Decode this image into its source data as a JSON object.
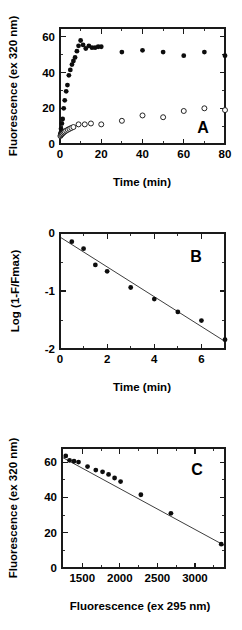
{
  "figure": {
    "panels": [
      "A",
      "B",
      "C"
    ],
    "marker_colors": {
      "filled": "#0d0d0d",
      "open_fill": "#ffffff",
      "open_stroke": "#0d0d0d",
      "axis": "#1a1a1a"
    }
  },
  "panel_a": {
    "letter": "A",
    "xlabel": "Time (min)",
    "ylabel": "Fluorescence (ex 320 nm)",
    "xticks": [
      "0",
      "20",
      "40",
      "60",
      "80"
    ],
    "yticks": [
      "0",
      "20",
      "40",
      "60"
    ]
  },
  "panel_b": {
    "letter": "B",
    "xlabel": "Time (min)",
    "ylabel": "Log (1-F/Fmax)",
    "xticks": [
      "0",
      "2",
      "4",
      "6"
    ],
    "yticks": [
      "-2",
      "-1",
      "0"
    ]
  },
  "panel_c": {
    "letter": "C",
    "xlabel": "Fluorescence (ex 295 nm)",
    "ylabel": "Fluorescence (ex 320 nm)",
    "xticks": [
      "1500",
      "2000",
      "2500",
      "3000"
    ],
    "yticks": [
      "0",
      "20",
      "40",
      "60"
    ]
  },
  "chart_data": [
    {
      "type": "scatter",
      "panel": "A",
      "title": "",
      "xlabel": "Time (min)",
      "ylabel": "Fluorescence (ex 320 nm)",
      "xlim": [
        0,
        80
      ],
      "ylim": [
        0,
        65
      ],
      "xticks": [
        0,
        20,
        40,
        60,
        80
      ],
      "yticks": [
        0,
        20,
        40,
        60
      ],
      "xminorticks": [
        10,
        30,
        50,
        70
      ],
      "yminorticks": [
        10,
        30,
        50
      ],
      "grid": false,
      "legend": false,
      "series": [
        {
          "name": "ex 320 nm (filled circles)",
          "marker": "filled-circle",
          "x": [
            0.2,
            0.5,
            0.9,
            1.3,
            1.8,
            2.3,
            3.0,
            3.6,
            4.3,
            5.0,
            5.8,
            6.5,
            7.3,
            8.2,
            9.0,
            10.0,
            11.2,
            12.5,
            14.0,
            15.5,
            17.0,
            18.5,
            20.0,
            30.0,
            40.0,
            50.0,
            60.0,
            70.0,
            80.0
          ],
          "y": [
            6.0,
            8.5,
            11.5,
            14.0,
            20.0,
            24.5,
            29.5,
            33.0,
            38.5,
            41.5,
            44.5,
            46.5,
            48.5,
            52.0,
            55.0,
            58.0,
            55.5,
            53.5,
            55.0,
            54.0,
            54.0,
            54.5,
            54.5,
            51.5,
            52.5,
            51.5,
            49.5,
            51.5,
            49.5
          ]
        },
        {
          "name": "ex 295 nm (open circles)",
          "marker": "open-circle",
          "x": [
            0.2,
            0.5,
            0.9,
            1.3,
            1.8,
            2.3,
            3.0,
            3.8,
            4.6,
            5.5,
            6.5,
            9.0,
            12.0,
            15.0,
            20.0,
            30.0,
            40.0,
            50.0,
            60.0,
            70.0,
            80.0
          ],
          "y": [
            4.5,
            5.0,
            5.5,
            6.0,
            6.5,
            7.0,
            7.5,
            8.0,
            8.5,
            9.0,
            9.5,
            11.0,
            11.0,
            11.5,
            11.0,
            13.0,
            16.0,
            15.0,
            18.5,
            20.0,
            19.0
          ]
        }
      ]
    },
    {
      "type": "scatter",
      "panel": "B",
      "title": "",
      "xlabel": "Time (min)",
      "ylabel": "Log (1-F/Fmax)",
      "xlim": [
        0,
        7
      ],
      "ylim": [
        -2,
        0
      ],
      "xticks": [
        0,
        2,
        4,
        6
      ],
      "yticks": [
        -2,
        -1,
        0
      ],
      "xminorticks": [
        1,
        3,
        5,
        7
      ],
      "yminorticks": [
        -1.5,
        -0.5
      ],
      "grid": false,
      "legend": false,
      "series": [
        {
          "name": "Log (1-F/Fmax)",
          "marker": "filled-circle",
          "x": [
            0.5,
            1.0,
            1.5,
            2.0,
            3.0,
            4.0,
            5.0,
            6.0,
            7.0
          ],
          "y": [
            -0.15,
            -0.27,
            -0.55,
            -0.66,
            -0.94,
            -1.14,
            -1.36,
            -1.51,
            -1.84
          ]
        }
      ],
      "fit_line": {
        "type": "linear",
        "x": [
          0,
          7
        ],
        "y": [
          -0.07,
          -1.87
        ]
      }
    },
    {
      "type": "scatter",
      "panel": "C",
      "title": "",
      "xlabel": "Fluorescence (ex 295 nm)",
      "ylabel": "Fluorescence (ex 320 nm)",
      "xlim": [
        1230,
        3400
      ],
      "ylim": [
        0,
        68
      ],
      "xticks": [
        1500,
        2000,
        2500,
        3000
      ],
      "yticks": [
        0,
        20,
        40,
        60
      ],
      "xminorticks": [
        1750,
        2250,
        2750,
        3250
      ],
      "yminorticks": [
        10,
        30,
        50
      ],
      "grid": false,
      "legend": false,
      "series": [
        {
          "name": "Fluorescence correlation",
          "marker": "filled-circle",
          "x": [
            1280,
            1330,
            1390,
            1450,
            1570,
            1680,
            1770,
            1850,
            1930,
            2010,
            2280,
            2680,
            3350
          ],
          "y": [
            63.5,
            61.0,
            60.5,
            60.0,
            57.5,
            55.5,
            54.5,
            53.0,
            51.0,
            49.0,
            41.5,
            31.0,
            13.5
          ]
        }
      ],
      "fit_line": {
        "type": "linear",
        "x": [
          1230,
          3400
        ],
        "y": [
          62.8,
          12.6
        ]
      }
    }
  ]
}
